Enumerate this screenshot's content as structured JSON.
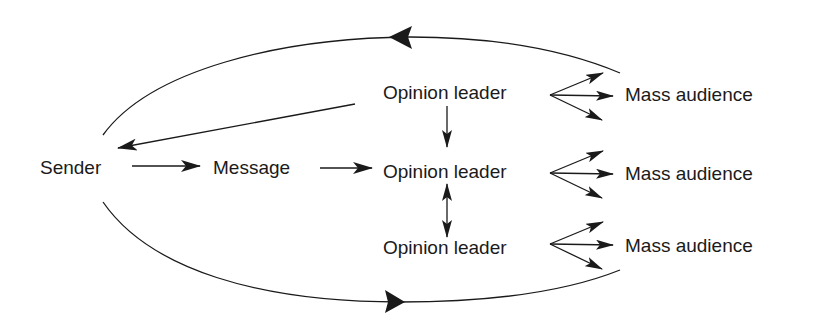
{
  "diagram": {
    "nodes": {
      "sender": "Sender",
      "message": "Message",
      "opinion_leader_1": "Opinion leader",
      "opinion_leader_2": "Opinion leader",
      "opinion_leader_3": "Opinion leader",
      "mass_audience_1": "Mass audience",
      "mass_audience_2": "Mass audience",
      "mass_audience_3": "Mass audience"
    },
    "edges": [
      {
        "from": "sender",
        "to": "message",
        "type": "arrow"
      },
      {
        "from": "message",
        "to": "opinion_leader_2",
        "type": "arrow"
      },
      {
        "from": "opinion_leader_1",
        "to": "sender",
        "type": "arrow"
      },
      {
        "from": "opinion_leader_1",
        "to": "opinion_leader_2",
        "type": "arrow"
      },
      {
        "from": "opinion_leader_2",
        "to": "opinion_leader_3",
        "type": "bidirectional"
      },
      {
        "from": "opinion_leader_1",
        "to": "mass_audience_1",
        "type": "fan-out-3"
      },
      {
        "from": "opinion_leader_2",
        "to": "mass_audience_2",
        "type": "fan-out-3"
      },
      {
        "from": "opinion_leader_3",
        "to": "mass_audience_3",
        "type": "fan-out-3"
      },
      {
        "from": "mass_audience_1",
        "to": "sender",
        "type": "feedback-arc-top"
      },
      {
        "from": "sender",
        "to": "mass_audience_3",
        "type": "arc-bottom"
      }
    ],
    "colors": {
      "line": "#1a1a1a",
      "background": "#ffffff"
    }
  }
}
